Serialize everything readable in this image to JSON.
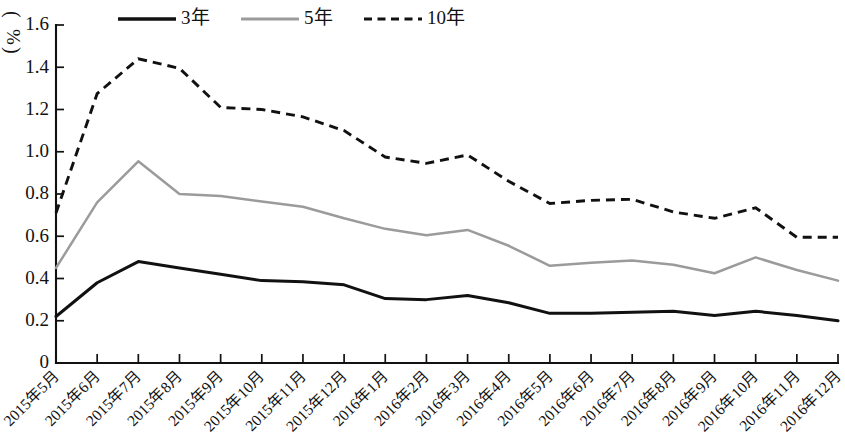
{
  "chart_data": {
    "type": "line",
    "title": "",
    "subtitle": "",
    "xlabel": "",
    "ylabel": "(%)",
    "ylabel_unit": "%",
    "ylim": [
      0,
      1.6
    ],
    "ytick_values": [
      0,
      0.2,
      0.4,
      0.6,
      0.8,
      1.0,
      1.2,
      1.4,
      1.6
    ],
    "ytick_labels": [
      "0",
      "0.2",
      "0.4",
      "0.6",
      "0.8",
      "1.0",
      "1.2",
      "1.4",
      "1.6"
    ],
    "grid": false,
    "legend_position": "top",
    "categories": [
      "2015年5月",
      "2015年6月",
      "2015年7月",
      "2015年8月",
      "2015年9月",
      "2015年10月",
      "2015年11月",
      "2015年12月",
      "2016年1月",
      "2016年2月",
      "2016年3月",
      "2016年4月",
      "2016年5月",
      "2016年6月",
      "2016年7月",
      "2016年8月",
      "2016年9月",
      "2016年10月",
      "2016年11月",
      "2016年12月"
    ],
    "series": [
      {
        "name": "3年",
        "color": "#111111",
        "style": "solid",
        "values": [
          0.22,
          0.38,
          0.48,
          0.45,
          0.42,
          0.39,
          0.385,
          0.37,
          0.305,
          0.3,
          0.32,
          0.285,
          0.235,
          0.235,
          0.24,
          0.245,
          0.225,
          0.245,
          0.225,
          0.2
        ]
      },
      {
        "name": "5年",
        "color": "#9b9b9b",
        "style": "solid",
        "values": [
          0.45,
          0.76,
          0.955,
          0.8,
          0.79,
          0.765,
          0.74,
          0.685,
          0.635,
          0.605,
          0.63,
          0.555,
          0.46,
          0.475,
          0.485,
          0.465,
          0.425,
          0.5,
          0.44,
          0.39
        ]
      },
      {
        "name": "10年",
        "color": "#111111",
        "style": "dashed",
        "values": [
          0.71,
          1.275,
          1.44,
          1.395,
          1.21,
          1.2,
          1.165,
          1.1,
          0.975,
          0.945,
          0.985,
          0.86,
          0.755,
          0.77,
          0.775,
          0.715,
          0.685,
          0.735,
          0.595,
          0.595
        ]
      }
    ]
  },
  "legend": {
    "items": [
      {
        "label": "3年",
        "style": "solid",
        "color": "#111111"
      },
      {
        "label": "5年",
        "style": "solid",
        "color": "#9b9b9b"
      },
      {
        "label": "10年",
        "style": "dashed",
        "color": "#111111"
      }
    ]
  },
  "axes": {
    "y_unit_open_paren": "(",
    "y_unit_symbol": "%",
    "y_unit_close_paren": ")"
  }
}
